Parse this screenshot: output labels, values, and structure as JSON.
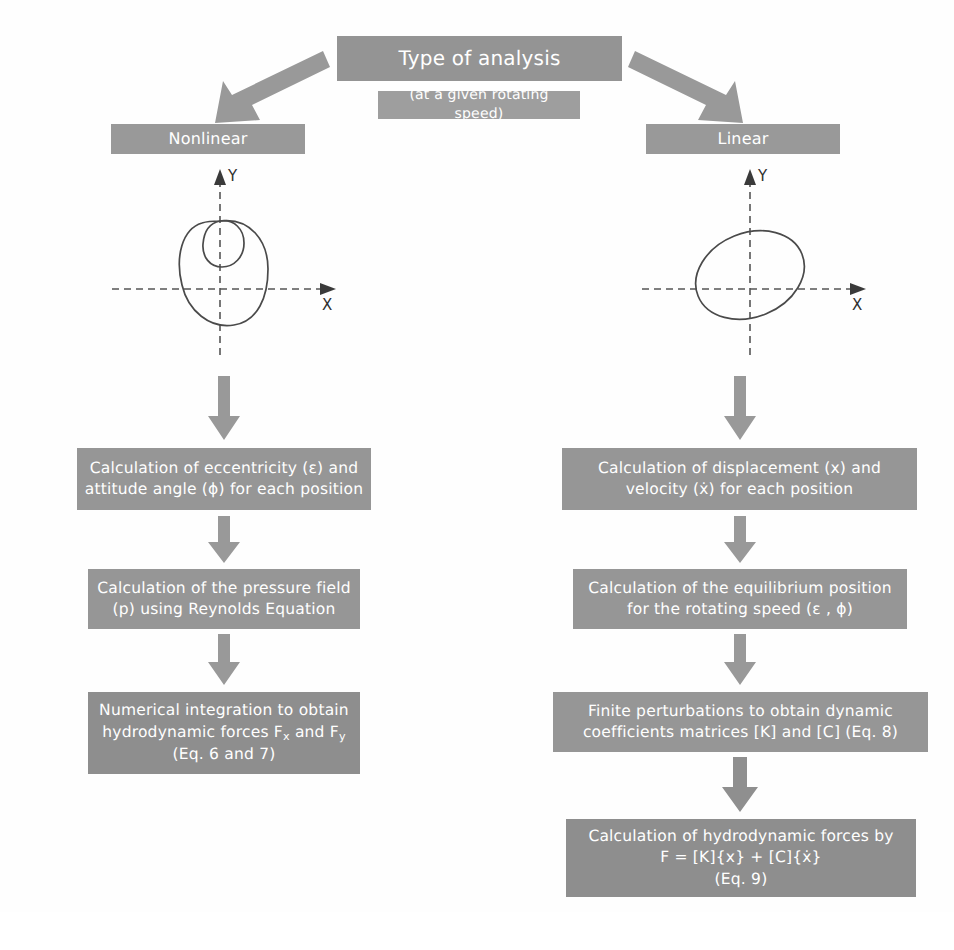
{
  "diagram": {
    "type": "flowchart",
    "title_box": {
      "label": "Type of analysis"
    },
    "subtitle_box": {
      "label": "(at a given rotating speed)"
    },
    "branches": [
      {
        "id": "nonlinear",
        "label": "Nonlinear"
      },
      {
        "id": "linear",
        "label": "Linear"
      }
    ],
    "plots": {
      "nonlinear": {
        "name": "nonlinear-orbit-plot",
        "x_axis_label": "X",
        "y_axis_label": "Y",
        "description": "nonlinear orbit with inner loop"
      },
      "linear": {
        "name": "linear-orbit-plot",
        "x_axis_label": "X",
        "y_axis_label": "Y",
        "description": "elliptical linear orbit"
      }
    },
    "left_column": [
      {
        "id": "left-step-1",
        "lines": [
          "Calculation of eccentricity (ε) and",
          "attitude angle (ϕ) for each position"
        ]
      },
      {
        "id": "left-step-2",
        "lines": [
          "Calculation of the pressure field",
          "(p) using Reynolds Equation"
        ]
      },
      {
        "id": "left-step-3",
        "lines": [
          "Numerical integration to obtain",
          "hydrodynamic forces F<sub>x</sub> and F<sub>y</sub>",
          "(Eq. 6 and 7)"
        ]
      }
    ],
    "right_column": [
      {
        "id": "right-step-1",
        "lines": [
          "Calculation of displacement (x) and",
          "velocity (ẋ) for each position"
        ]
      },
      {
        "id": "right-step-2",
        "lines": [
          "Calculation of the equilibrium position",
          "for the rotating speed (ε , ϕ)"
        ]
      },
      {
        "id": "right-step-3",
        "lines": [
          "Finite perturbations to obtain dynamic",
          "coefficients matrices [K] and [C] (Eq. 8)"
        ]
      },
      {
        "id": "right-step-4",
        "lines": [
          "Calculation of hydrodynamic forces by",
          "F = [K]{x} + [C]{ẋ}",
          "(Eq. 9)"
        ]
      }
    ],
    "colors": {
      "box_fill": "#969696",
      "box_fill_title": "#949494",
      "box_fill_dark": "#8e8e8e",
      "box_text": "#ffffff",
      "arrow": "#999999",
      "curve_stroke": "#4a4a4a",
      "axis_stroke": "#555555",
      "background": "#ffffff"
    },
    "arrows": [
      {
        "id": "arrow-title-to-nonlinear",
        "from": "title_box",
        "to": "nonlinear",
        "direction": "down-left"
      },
      {
        "id": "arrow-title-to-linear",
        "from": "title_box",
        "to": "linear",
        "direction": "down-right"
      },
      {
        "id": "arrow-left-plot-to-step1",
        "from": "nonlinear-orbit-plot",
        "to": "left-step-1",
        "direction": "down"
      },
      {
        "id": "arrow-left-step1-to-step2",
        "from": "left-step-1",
        "to": "left-step-2",
        "direction": "down"
      },
      {
        "id": "arrow-left-step2-to-step3",
        "from": "left-step-2",
        "to": "left-step-3",
        "direction": "down"
      },
      {
        "id": "arrow-right-plot-to-step1",
        "from": "linear-orbit-plot",
        "to": "right-step-1",
        "direction": "down"
      },
      {
        "id": "arrow-right-step1-to-step2",
        "from": "right-step-1",
        "to": "right-step-2",
        "direction": "down"
      },
      {
        "id": "arrow-right-step2-to-step3",
        "from": "right-step-2",
        "to": "right-step-3",
        "direction": "down"
      },
      {
        "id": "arrow-right-step3-to-step4",
        "from": "right-step-3",
        "to": "right-step-4",
        "direction": "down"
      }
    ]
  }
}
